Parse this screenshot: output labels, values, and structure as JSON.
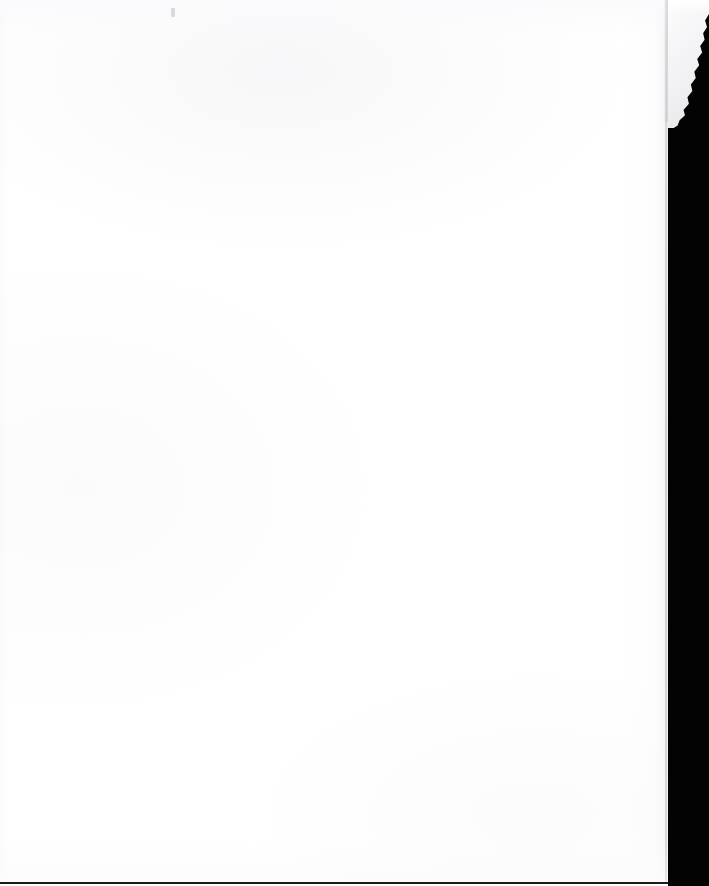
{
  "document": {
    "title": "Scanned blank page",
    "description": "Blank scanned paper sheet with black scanner backdrop on the right and a torn curled corner at the top right.",
    "page_text": "",
    "visible_text_content": "",
    "caption": "Blank scanned page"
  },
  "canvas": {
    "width": 709,
    "height": 886
  },
  "regions": {
    "paper": {
      "name": "paper-sheet",
      "left": 0,
      "top": 0,
      "width": 668,
      "height": 886,
      "color": "#ffffff"
    },
    "backdrop": {
      "name": "scanner-backdrop",
      "left": 668,
      "top": 0,
      "width": 41,
      "height": 886,
      "color": "#030303"
    },
    "torn_corner": {
      "name": "torn-corner",
      "left": 660,
      "top": 0,
      "width": 49,
      "height": 128,
      "color": "#f2f2f4"
    },
    "bottom_rule": {
      "name": "bottom-edge-rule",
      "left": 0,
      "bottom": 2,
      "width": 668,
      "height": 2,
      "color": "#1b1b1b"
    },
    "edge_rule": {
      "name": "paper-edge-rule",
      "left": 665,
      "top": 0,
      "width": 2,
      "height": 886,
      "color": "#cecedc"
    },
    "speck": {
      "name": "scan-speck",
      "left": 171,
      "top": 8,
      "width": 4,
      "height": 9,
      "color": "#bebec4"
    }
  },
  "colors": {
    "paper_white": "#ffffff",
    "paper_tint": "#fbfbfc",
    "backdrop_black": "#030303",
    "edge_gray": "#e9e9ea",
    "rule_dark": "#1b1b1b"
  }
}
